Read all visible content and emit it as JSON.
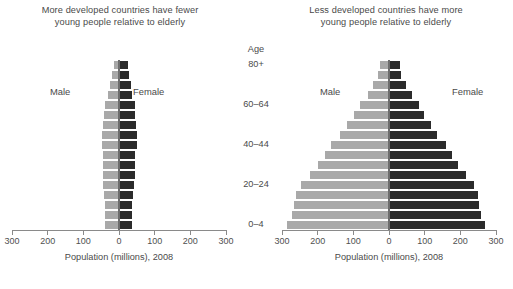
{
  "figure": {
    "age_axis_title": "Age",
    "x_caption": "Population (millions), 2008",
    "series": {
      "male_label": "Male",
      "female_label": "Female"
    },
    "colors": {
      "male": "#a9a9a9",
      "female": "#2b2b2b",
      "axis": "#8a8a8a",
      "text": "#4a4a4a"
    }
  },
  "panels": [
    {
      "id": "more-developed",
      "title": "More developed countries have fewer young people relative to elderly",
      "title_line1": "More developed countries have fewer",
      "title_line2": "young people relative to elderly"
    },
    {
      "id": "less-developed",
      "title": "Less developed countries have more young people relative to elderly",
      "title_line1": "Less developed countries have more",
      "title_line2": "young people relative to elderly"
    }
  ],
  "chart_data": {
    "type": "bar",
    "subtype": "population-pyramid",
    "xlabel": "Population (millions), 2008",
    "ylabel": "Age",
    "xlim": [
      -300,
      300
    ],
    "xticks": [
      -300,
      -200,
      -100,
      0,
      100,
      200,
      300
    ],
    "xticklabels": [
      "300",
      "200",
      "100",
      "0",
      "100",
      "200",
      "300"
    ],
    "grid": false,
    "legend": [
      "Male",
      "Female"
    ],
    "legend_position": "inline-sides",
    "age_groups": [
      "0-4",
      "5-9",
      "10-14",
      "15-19",
      "20-24",
      "25-29",
      "30-34",
      "35-39",
      "40-44",
      "45-49",
      "50-54",
      "55-59",
      "60-64",
      "65-69",
      "70-74",
      "75-79",
      "80+"
    ],
    "age_ticklabels": [
      "0–4",
      "20–24",
      "40–44",
      "60–64",
      "80+"
    ],
    "charts": [
      {
        "name": "More developed countries have fewer young people relative to elderly",
        "series": [
          {
            "name": "Male",
            "side": "left",
            "values": [
              38,
              38,
              39,
              42,
              44,
              45,
              44,
              45,
              49,
              49,
              46,
              42,
              40,
              32,
              26,
              20,
              14
            ]
          },
          {
            "name": "Female",
            "side": "right",
            "values": [
              36,
              36,
              37,
              40,
              42,
              44,
              44,
              46,
              50,
              51,
              49,
              46,
              44,
              37,
              33,
              28,
              26
            ]
          }
        ]
      },
      {
        "name": "Less developed countries have more young people relative to elderly",
        "series": [
          {
            "name": "Male",
            "side": "left",
            "values": [
              285,
              272,
              266,
              262,
              248,
              222,
              198,
              180,
              162,
              137,
              118,
              98,
              80,
              60,
              44,
              30,
              24
            ]
          },
          {
            "name": "Female",
            "side": "right",
            "values": [
              270,
              258,
              252,
              250,
              238,
              215,
              193,
              176,
              159,
              135,
              117,
              99,
              83,
              64,
              49,
              35,
              32
            ]
          }
        ]
      }
    ]
  }
}
